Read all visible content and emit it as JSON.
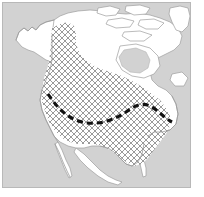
{
  "figure": {
    "type": "distribution-range-map",
    "region": "North America",
    "title": "",
    "width_px": 204,
    "height_px": 197
  },
  "map": {
    "frame": {
      "x": 2,
      "y": 2,
      "width": 189,
      "height": 186,
      "border_color": "#b8b8b8"
    },
    "ocean_color": "#d2d2d2",
    "land_color": "#ffffff",
    "coastline_color": "#9a9a9a",
    "hatch": {
      "label": "species range (cross-hatched)",
      "line_color": "#8f8f8f",
      "spacing_px": 6,
      "line_width_px": 0.9,
      "angles_deg": [
        45,
        -45
      ]
    },
    "dashed_line": {
      "label": "range limit boundary",
      "color": "#111111",
      "width_px": 3.1,
      "dash_pattern": "6 4",
      "path": "M 46,92 C 54,104 64,116 80,120 C 96,124 112,118 124,110 C 132,104 140,100 148,104 C 156,108 162,116 170,120"
    },
    "legend": {
      "visible": false,
      "entries": [
        {
          "label": "range (hatched)",
          "symbol": "crosshatch"
        },
        {
          "label": "boundary",
          "symbol": "dashed-line"
        }
      ]
    },
    "axis_labels": {
      "visible": false,
      "x": "",
      "y": ""
    },
    "scale_bar": {
      "visible": false,
      "text": ""
    },
    "north_arrow": {
      "visible": false,
      "text": ""
    }
  }
}
